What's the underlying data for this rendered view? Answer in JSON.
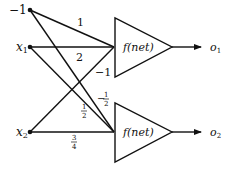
{
  "diagram": {
    "type": "single-layer perceptron network",
    "inputs": [
      {
        "id": "bias",
        "label": "−1",
        "sub": ""
      },
      {
        "id": "x1",
        "label": "x",
        "sub": "1"
      },
      {
        "id": "x2",
        "label": "x",
        "sub": "2"
      }
    ],
    "units": [
      {
        "id": "unit1",
        "label": "f(net)",
        "output_label": "o",
        "output_sub": "1"
      },
      {
        "id": "unit2",
        "label": "f(net)",
        "output_label": "o",
        "output_sub": "2"
      }
    ],
    "weights": [
      {
        "from": "bias",
        "to": "unit1",
        "label": "1"
      },
      {
        "from": "x1",
        "to": "unit1",
        "label": "2"
      },
      {
        "from": "x2",
        "to": "unit1",
        "label": "−1"
      },
      {
        "from": "bias",
        "to": "unit2",
        "label_sign": "−",
        "label_num": "1",
        "label_den": "2"
      },
      {
        "from": "x1",
        "to": "unit2",
        "label_sign": "",
        "label_num": "1",
        "label_den": "2"
      },
      {
        "from": "x2",
        "to": "unit2",
        "label_sign": "",
        "label_num": "3",
        "label_den": "4"
      }
    ],
    "colors": {
      "stroke": "#111111",
      "background": "#ffffff"
    }
  }
}
